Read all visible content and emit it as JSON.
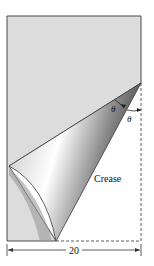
{
  "diagram": {
    "labels": {
      "theta_left": "θ",
      "theta_right": "θ",
      "crease": "Crease",
      "width": "20"
    },
    "colors": {
      "page": "#dcdcdc",
      "edge": "#4a4a4a",
      "background": "#ffffff"
    }
  }
}
